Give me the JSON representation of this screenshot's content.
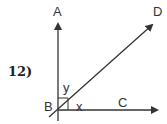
{
  "problem": {
    "number": "12)"
  },
  "diagram": {
    "points": {
      "A": "A",
      "B": "B",
      "C": "C",
      "D": "D"
    },
    "angles": {
      "x": "x",
      "y": "y"
    },
    "right_angle_at": "B",
    "colors": {
      "stroke": "#333333"
    }
  }
}
